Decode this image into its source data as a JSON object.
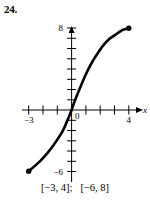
{
  "exercise": {
    "number": "24."
  },
  "caption": {
    "text": "[−3, 4];   [−6, 8]"
  },
  "chart_data": {
    "type": "line",
    "title": "",
    "xlabel": "x",
    "ylabel": "",
    "xlim": [
      -3.6,
      4.6
    ],
    "ylim": [
      -7.2,
      8.8
    ],
    "grid": false,
    "legend": null,
    "x_tick_labels": [
      "−3",
      "4"
    ],
    "y_tick_labels": [
      "8",
      "−6"
    ],
    "origin_label": "0",
    "x_ticks": [
      -3,
      -2,
      -1,
      1,
      2,
      3,
      4
    ],
    "y_ticks": [
      -6,
      -5,
      -4,
      -3,
      -2,
      -1,
      1,
      2,
      3,
      4,
      5,
      6,
      7,
      8
    ],
    "domain": "[−3, 4]",
    "range": "[−6, 8]",
    "endpoints": [
      {
        "x": -3,
        "y": -6,
        "filled": true
      },
      {
        "x": 4,
        "y": 8,
        "filled": true
      }
    ],
    "series": [
      {
        "name": "curve",
        "color": "#000000",
        "x": [
          -3.0,
          -2.6,
          -2.2,
          -1.8,
          -1.4,
          -1.0,
          -0.6,
          -0.2,
          0.0,
          0.2,
          0.6,
          1.0,
          1.4,
          1.8,
          2.2,
          2.6,
          3.0,
          3.4,
          3.7,
          4.0
        ],
        "y": [
          -6.0,
          -5.5,
          -5.0,
          -4.4,
          -3.7,
          -2.9,
          -2.0,
          -0.7,
          0.0,
          0.8,
          2.2,
          3.5,
          4.6,
          5.5,
          6.3,
          6.9,
          7.3,
          7.7,
          7.9,
          8.0
        ]
      }
    ]
  }
}
